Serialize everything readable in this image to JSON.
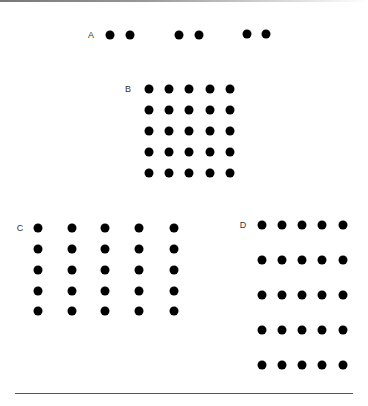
{
  "figure": {
    "dot_color": "#000000",
    "groups": [
      {
        "label": "A",
        "label_pos": [
          91,
          35
        ],
        "dots": [
          [
            110,
            35
          ],
          [
            130,
            35
          ],
          [
            179,
            35
          ],
          [
            199,
            35
          ],
          [
            247,
            34
          ],
          [
            266,
            34
          ]
        ]
      },
      {
        "label": "B",
        "label_pos": [
          128,
          89
        ],
        "cols": [
          149,
          169,
          189,
          210,
          230
        ],
        "rows": [
          89,
          110,
          131,
          152,
          173
        ]
      },
      {
        "label": "C",
        "label_pos": [
          20,
          228
        ],
        "cols": [
          38,
          72,
          105,
          139,
          174
        ],
        "rows": [
          228,
          249,
          270,
          291,
          311
        ]
      },
      {
        "label": "D",
        "label_pos": [
          243,
          225
        ],
        "cols": [
          262,
          282,
          302,
          322,
          343
        ],
        "rows": [
          225,
          260,
          295,
          330,
          365
        ]
      }
    ]
  }
}
